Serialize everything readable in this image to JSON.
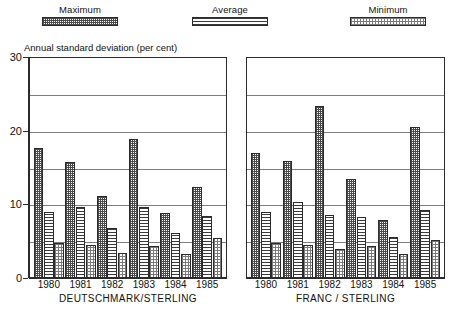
{
  "legend": {
    "items": [
      {
        "key": "maximum",
        "label": "Maximum",
        "pattern": "dense-dot"
      },
      {
        "key": "average",
        "label": "Average",
        "pattern": "horizontal-lines"
      },
      {
        "key": "minimum",
        "label": "Minimum",
        "pattern": "light-dot"
      }
    ]
  },
  "axis_title": "Annual standard deviation (per cent)",
  "chart_data": [
    {
      "type": "bar",
      "id": "deutschmark-sterling",
      "title": "DEUTSCHMARK/STERLING",
      "xlabel": "DEUTSCHMARK/STERLING",
      "ylabel": "Annual standard deviation (per cent)",
      "ylim": [
        0,
        30
      ],
      "yticks": [
        0,
        10,
        20,
        30
      ],
      "ytick_labels": [
        "0",
        "10",
        "20",
        "30"
      ],
      "gridlines": [
        5,
        10,
        15,
        20,
        25
      ],
      "grid": true,
      "legend_position": "top",
      "categories": [
        "1980",
        "1981",
        "1982",
        "1983",
        "1984",
        "1985"
      ],
      "series": [
        {
          "name": "Maximum",
          "values": [
            17.6,
            15.8,
            11.2,
            18.9,
            8.8,
            12.3
          ]
        },
        {
          "name": "Average",
          "values": [
            9.0,
            9.7,
            6.8,
            9.7,
            6.1,
            8.4
          ]
        },
        {
          "name": "Minimum",
          "values": [
            4.7,
            4.5,
            3.4,
            4.4,
            3.3,
            5.4
          ]
        }
      ]
    },
    {
      "type": "bar",
      "id": "franc-sterling",
      "title": "FRANC / STERLING",
      "xlabel": "FRANC / STERLING",
      "ylabel": "Annual standard deviation (per cent)",
      "ylim": [
        0,
        30
      ],
      "yticks": [
        0,
        10,
        20,
        30
      ],
      "ytick_labels": [
        "0",
        "10",
        "20",
        "30"
      ],
      "gridlines": [
        5,
        10,
        15,
        20,
        25
      ],
      "grid": true,
      "legend_position": "top",
      "categories": [
        "1980",
        "1981",
        "1982",
        "1983",
        "1984",
        "1985"
      ],
      "series": [
        {
          "name": "Maximum",
          "values": [
            17.0,
            15.9,
            23.4,
            13.5,
            7.9,
            20.5
          ]
        },
        {
          "name": "Average",
          "values": [
            9.0,
            10.3,
            8.6,
            8.3,
            5.6,
            9.3
          ]
        },
        {
          "name": "Minimum",
          "values": [
            4.8,
            4.5,
            3.9,
            4.3,
            3.2,
            5.2
          ]
        }
      ]
    }
  ],
  "colors": {
    "axis": "#2b2b2b",
    "grid": "#7d7d7d",
    "background": "#ffffff",
    "text": "#111111"
  }
}
